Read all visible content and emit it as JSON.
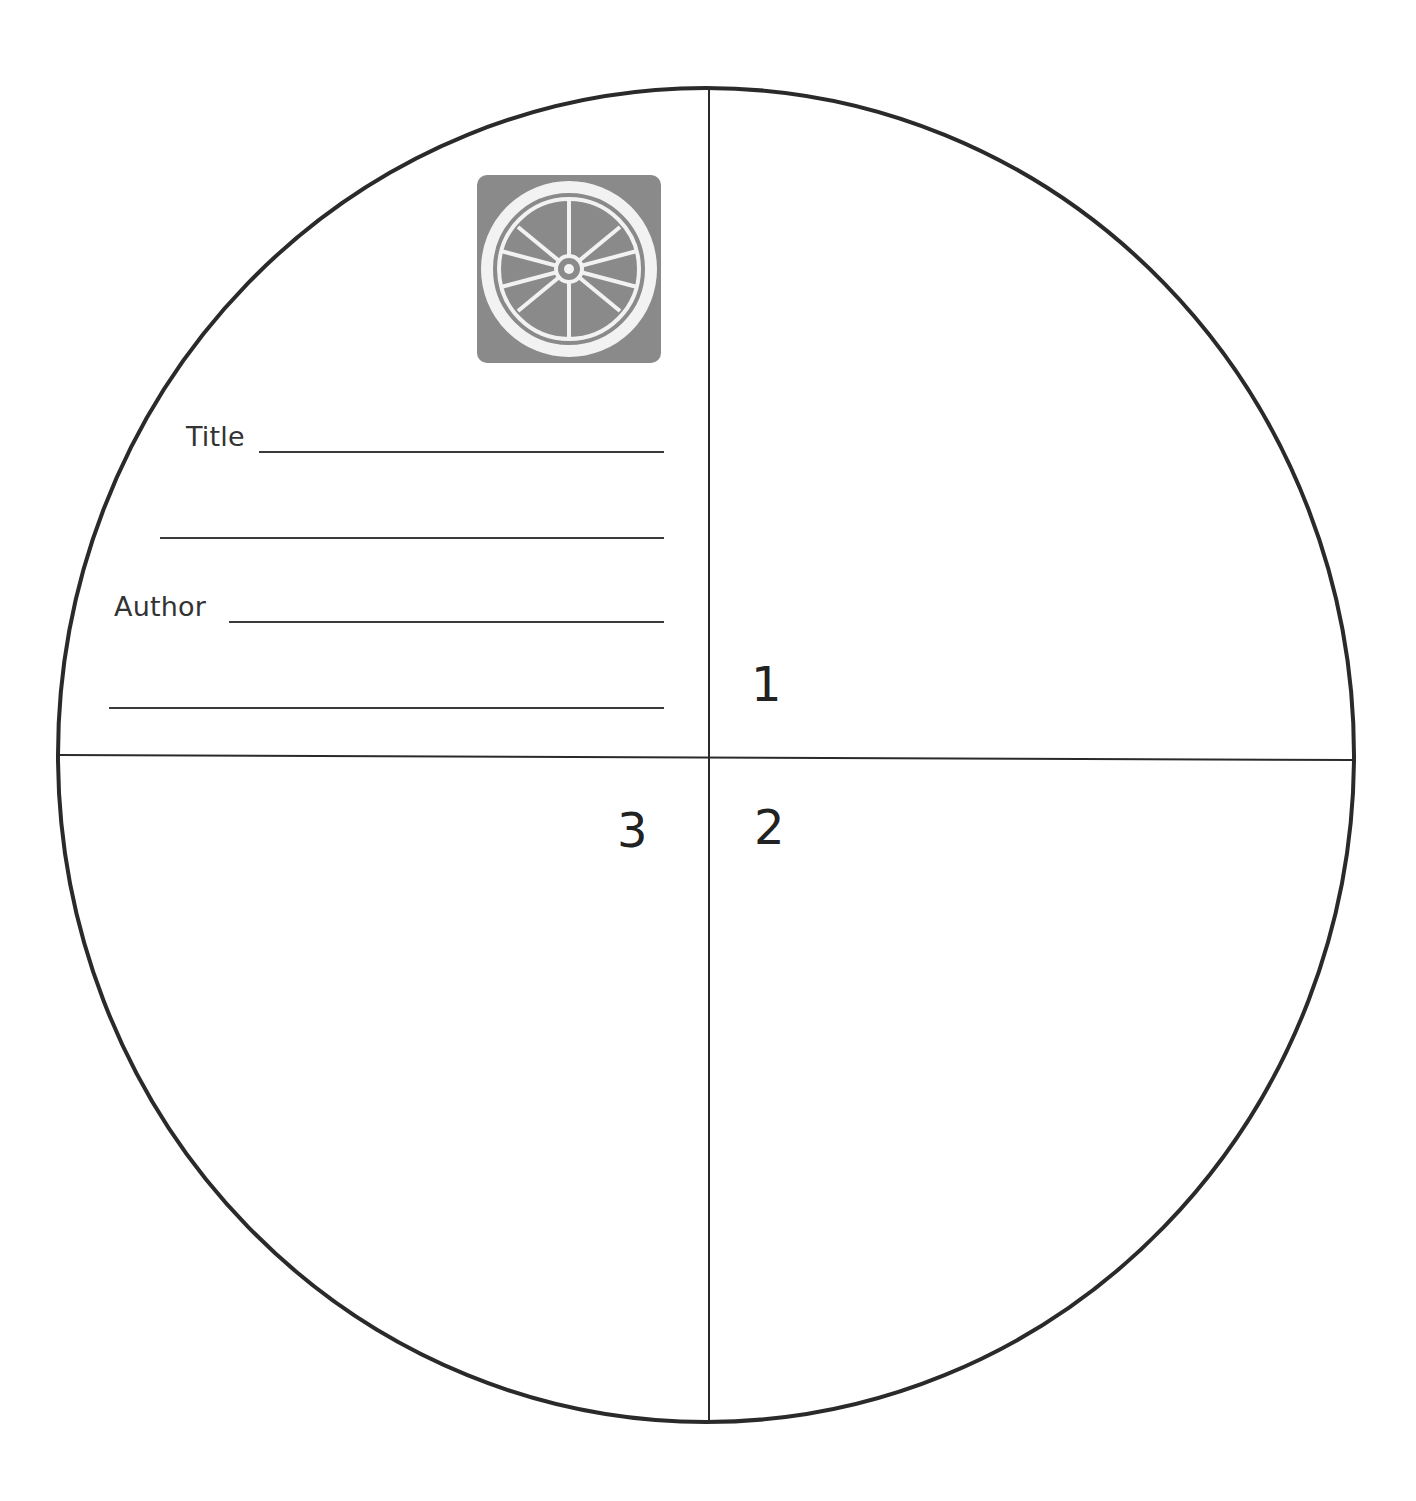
{
  "worksheet": {
    "fields": [
      {
        "label": "Title",
        "name": "title"
      },
      {
        "label": "",
        "name": "title-continued"
      },
      {
        "label": "Author",
        "name": "author"
      },
      {
        "label": "",
        "name": "author-continued"
      }
    ],
    "quadrants": [
      {
        "number": "1",
        "position": "upper-right"
      },
      {
        "number": "2",
        "position": "lower-right"
      },
      {
        "number": "3",
        "position": "lower-left"
      }
    ],
    "logo": {
      "icon": "wagon-wheel-icon"
    },
    "colors": {
      "outline": "#2a2a2a",
      "logo_background": "#8a8a8a",
      "logo_foreground": "#f2f2f2"
    }
  }
}
